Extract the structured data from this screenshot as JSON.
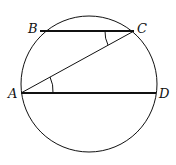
{
  "diagram": {
    "labels": {
      "A": "A",
      "B": "B",
      "C": "C",
      "D": "D"
    },
    "circle": {
      "cx": 89,
      "cy": 84,
      "r": 68
    },
    "points": {
      "A": [
        21,
        93
      ],
      "B": [
        40,
        31
      ],
      "C": [
        134,
        31
      ],
      "D": [
        156,
        93
      ]
    },
    "segments": [
      "BC",
      "AD",
      "AC"
    ],
    "angle_marks": [
      "BCA",
      "CAD"
    ],
    "stroke_color": "#111111"
  }
}
